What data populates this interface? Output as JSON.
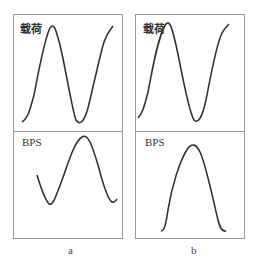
{
  "panels": [
    {
      "id": "a",
      "caption": "a",
      "top_label": "载荷",
      "bottom_label": "BPS"
    },
    {
      "id": "b",
      "caption": "b",
      "top_label": "载荷",
      "bottom_label": "BPS"
    }
  ],
  "colors": {
    "line": "#333333",
    "border": "#9a9a9a"
  }
}
